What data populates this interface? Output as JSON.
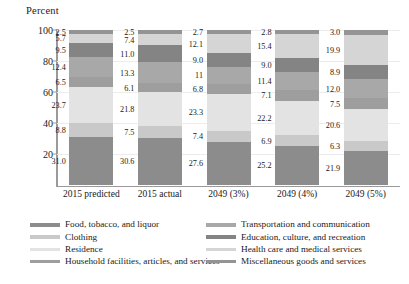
{
  "chart_data": {
    "type": "bar",
    "subtype": "stacked-bar-100",
    "title": "",
    "ylabel": "Percent",
    "xlabel": "",
    "ylim": [
      0,
      100
    ],
    "yticks": [
      20,
      40,
      60,
      80,
      100
    ],
    "grid": true,
    "legend_position": "bottom",
    "categories": [
      "2015 predicted",
      "2015 actual",
      "2049 (3%)",
      "2049 (4%)",
      "2049 (5%)"
    ],
    "series": [
      {
        "name": "Food, tobacco, and liquor",
        "color": "#8c8c8c",
        "values": [
          31.0,
          30.6,
          27.6,
          25.2,
          21.9
        ],
        "labels": [
          "31.0",
          "30.6",
          "27.6",
          "25.2",
          "21.9"
        ]
      },
      {
        "name": "Clothing",
        "color": "#c9c9c9",
        "values": [
          8.8,
          7.5,
          7.4,
          6.9,
          6.3
        ],
        "labels": [
          "8.8",
          "7.5",
          "7.4",
          "6.9",
          "6.3"
        ]
      },
      {
        "name": "Residence",
        "color": "#e3e3e3",
        "values": [
          23.7,
          21.8,
          23.3,
          22.2,
          20.6
        ],
        "labels": [
          "23.7",
          "21.8",
          "23.3",
          "22.2",
          "20.6"
        ]
      },
      {
        "name": "Household facilities, articles, and services",
        "color": "#9e9e9e",
        "values": [
          6.5,
          6.1,
          6.8,
          7.1,
          7.5
        ],
        "labels": [
          "6.5",
          "6.1",
          "6.8",
          "7.1",
          "7.5"
        ]
      },
      {
        "name": "Transportation and communication",
        "color": "#a8a8a8",
        "values": [
          12.4,
          13.3,
          11.0,
          11.4,
          12.0
        ],
        "labels": [
          "12.4",
          "13.3",
          "11",
          "11.4",
          "12.0"
        ]
      },
      {
        "name": "Education, culture, and recreation",
        "color": "#848484",
        "values": [
          9.5,
          11.0,
          9.0,
          9.0,
          8.9
        ],
        "labels": [
          "9.5",
          "11.0",
          "9.0",
          "9.0",
          "8.9"
        ]
      },
      {
        "name": "Health care and medical services",
        "color": "#d5d5d5",
        "values": [
          5.7,
          7.4,
          12.1,
          15.4,
          19.9
        ],
        "labels": [
          "5.7",
          "7.4",
          "12.1",
          "15.4",
          "19.9"
        ]
      },
      {
        "name": "Miscellaneous goods and services",
        "color": "#949494",
        "values": [
          2.5,
          2.5,
          2.7,
          2.8,
          3.0
        ],
        "labels": [
          "2.5",
          "2.5",
          "2.7",
          "2.8",
          "3.0"
        ]
      }
    ]
  },
  "legend": {
    "items": [
      {
        "label": "Food, tobacco, and liquor",
        "color": "#8c8c8c"
      },
      {
        "label": "Clothing",
        "color": "#c9c9c9"
      },
      {
        "label": "Residence",
        "color": "#e3e3e3"
      },
      {
        "label": "Household facilities, articles, and services",
        "color": "#9e9e9e"
      },
      {
        "label": "Transportation and communication",
        "color": "#a8a8a8"
      },
      {
        "label": "Education, culture, and recreation",
        "color": "#848484"
      },
      {
        "label": "Health care and medical services",
        "color": "#d5d5d5"
      },
      {
        "label": "Miscellaneous goods and services",
        "color": "#949494"
      }
    ]
  }
}
